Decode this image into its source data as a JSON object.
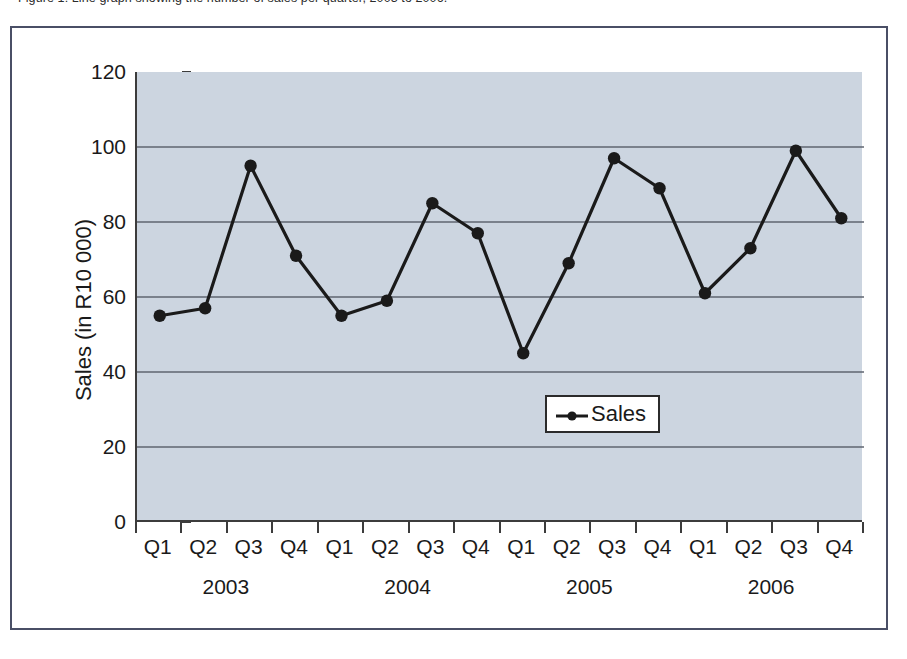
{
  "caption": {
    "text": "Figure 1: Line graph showing the number of sales per quarter, 2003 to 2006."
  },
  "chart_data": {
    "type": "line",
    "title": "",
    "xlabel": "",
    "ylabel": "Sales (in R10 000)",
    "ylim": [
      0,
      120
    ],
    "ytick_labels": [
      "120",
      "100",
      "80",
      "60",
      "40",
      "20",
      "0"
    ],
    "yticks": [
      120,
      100,
      80,
      60,
      40,
      20,
      0
    ],
    "grid": true,
    "grid_axis": "y",
    "legend_position": "inside-center-right",
    "categories": [
      "Q1",
      "Q2",
      "Q3",
      "Q4",
      "Q1",
      "Q2",
      "Q3",
      "Q4",
      "Q1",
      "Q2",
      "Q3",
      "Q4",
      "Q1",
      "Q2",
      "Q3",
      "Q4"
    ],
    "groups": [
      {
        "label": "2003",
        "span": 4
      },
      {
        "label": "2004",
        "span": 4
      },
      {
        "label": "2005",
        "span": 4
      },
      {
        "label": "2006",
        "span": 4
      }
    ],
    "series": [
      {
        "name": "Sales",
        "color": "#1a1a1a",
        "marker": "circle",
        "values": [
          55,
          57,
          95,
          71,
          55,
          59,
          85,
          77,
          45,
          69,
          97,
          89,
          61,
          73,
          99,
          81
        ]
      }
    ]
  },
  "legend": {
    "entries": [
      {
        "label": "Sales",
        "color": "#1a1a1a"
      }
    ]
  },
  "colors": {
    "plot_background": "#ccd5e0",
    "frame_border": "#4a4f66",
    "axis": "#3c3c3c",
    "gridline": "#5f6570",
    "series": "#1a1a1a",
    "page_background": "#ffffff"
  }
}
